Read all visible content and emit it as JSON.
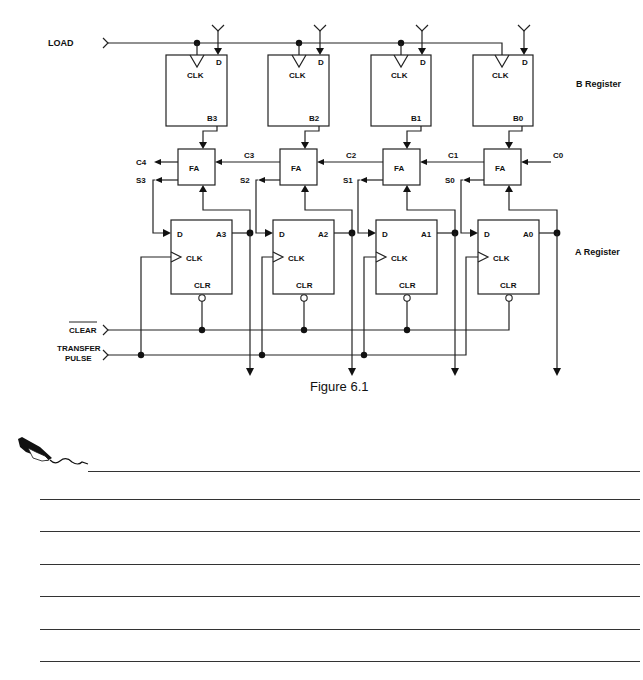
{
  "figure": {
    "caption": "Figure 6.1",
    "inputs": {
      "load": "LOAD",
      "clear": "CLEAR",
      "transfer_line1": "TRANSFER",
      "transfer_line2": "PULSE"
    },
    "register_labels": {
      "b_register": "B Register",
      "a_register": "A Register"
    },
    "b_register": [
      {
        "clk": "CLK",
        "d": "D",
        "out": "B3"
      },
      {
        "clk": "CLK",
        "d": "D",
        "out": "B2"
      },
      {
        "clk": "CLK",
        "d": "D",
        "out": "B1"
      },
      {
        "clk": "CLK",
        "d": "D",
        "out": "B0"
      }
    ],
    "adders": [
      {
        "label": "FA",
        "carry_out": "C4",
        "carry_in": "C3",
        "sum": "S3"
      },
      {
        "label": "FA",
        "carry_out": "C3",
        "carry_in": "C2",
        "sum": "S2"
      },
      {
        "label": "FA",
        "carry_out": "C2",
        "carry_in": "C1",
        "sum": "S1"
      },
      {
        "label": "FA",
        "carry_out": "C1",
        "carry_in": "C0",
        "sum": "S0"
      }
    ],
    "carry_labels": [
      "C4",
      "C3",
      "C2",
      "C1",
      "C0"
    ],
    "sum_labels": [
      "S3",
      "S2",
      "S1",
      "S0"
    ],
    "a_register": [
      {
        "d": "D",
        "clk": "CLK",
        "clr": "CLR",
        "out": "A3"
      },
      {
        "d": "D",
        "clk": "CLK",
        "clr": "CLR",
        "out": "A2"
      },
      {
        "d": "D",
        "clk": "CLK",
        "clr": "CLR",
        "out": "A1"
      },
      {
        "d": "D",
        "clk": "CLK",
        "clr": "CLR",
        "out": "A0"
      }
    ]
  },
  "notes": {
    "icon": "pen-writing-icon",
    "line_count": 7
  }
}
